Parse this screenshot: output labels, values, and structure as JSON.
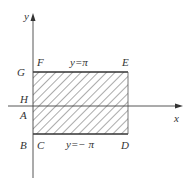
{
  "diagram": {
    "axes": {
      "x_label": "x",
      "y_label": "y"
    },
    "lines": {
      "top": {
        "equation": "y=π",
        "label": "y=π"
      },
      "bottom": {
        "equation": "y=−π",
        "label": "y=− π"
      }
    },
    "points": {
      "F": "F",
      "E": "E",
      "G": "G",
      "H": "H",
      "A": "A",
      "B": "B",
      "C": "C",
      "D": "D"
    },
    "region": {
      "fill": "hatched",
      "color": "#333333"
    }
  }
}
